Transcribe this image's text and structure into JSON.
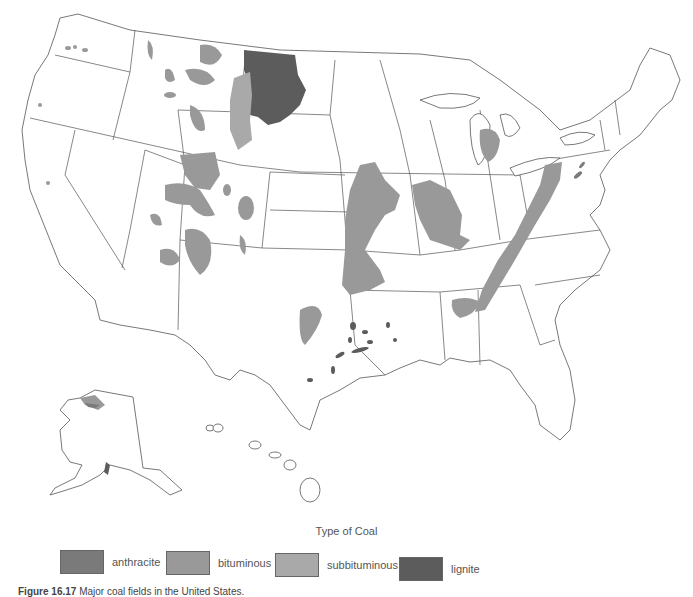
{
  "map": {
    "title": "Major coal fields in the United States",
    "colors": {
      "anthracite": "#7a7a7a",
      "bituminous": "#999999",
      "subbituminous": "#a9a9a9",
      "lignite": "#5c5c5c",
      "outline": "#555555"
    }
  },
  "legend": {
    "title": "Type of Coal",
    "items": [
      {
        "key": "anthracite",
        "label": "anthracite",
        "color": "#7a7a7a"
      },
      {
        "key": "bituminous",
        "label": "bituminous",
        "color": "#999999"
      },
      {
        "key": "subbituminous",
        "label": "subbituminous",
        "color": "#a9a9a9"
      },
      {
        "key": "lignite",
        "label": "lignite",
        "color": "#5c5c5c"
      }
    ]
  },
  "caption": {
    "figure_number": "Figure 16.17",
    "text": "Major coal fields in the United States."
  }
}
